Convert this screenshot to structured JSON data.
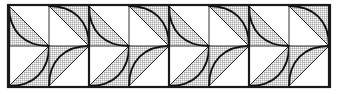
{
  "figure": {
    "title": "Pinwheel tiling of curved triangular tiles",
    "type": "geometric-pattern",
    "canvas": {
      "width": 337,
      "height": 94,
      "background_color": "#ffffff"
    },
    "border": {
      "x": 8,
      "y": 5,
      "width": 322,
      "height": 82,
      "stroke_color": "#1a1a1a",
      "stroke_width": 2.2,
      "fill": "none"
    },
    "grid": {
      "columns": 8,
      "rows": 2,
      "cell_size": 40,
      "origin_x": 9,
      "origin_y": 6,
      "cell_count": 16
    },
    "pinwheels": {
      "count": 4,
      "centers_x": [
        49,
        129,
        209,
        289
      ],
      "center_y": 46,
      "spokes_per_rosette": 8,
      "spacing": 80
    },
    "hatch": {
      "pattern": "cross-hatch",
      "spacing": 2,
      "line_width": 0.55,
      "line_color": "#555555",
      "background": "#ffffff"
    },
    "strokes": {
      "diagonal_color": "#2a2a2a",
      "diagonal_width": 1.0,
      "curve_color": "#111111",
      "curve_width": 1.9,
      "divider_color": "#1a1a1a",
      "heavy_divider_width": 2.2,
      "light_divider_width": 0.9
    },
    "heavy_vertical_dividers_x": [
      9,
      89,
      169,
      249,
      329
    ],
    "light_vertical_dividers_x": [
      49,
      129,
      209,
      289
    ],
    "horizontal_divider_y": 46
  }
}
